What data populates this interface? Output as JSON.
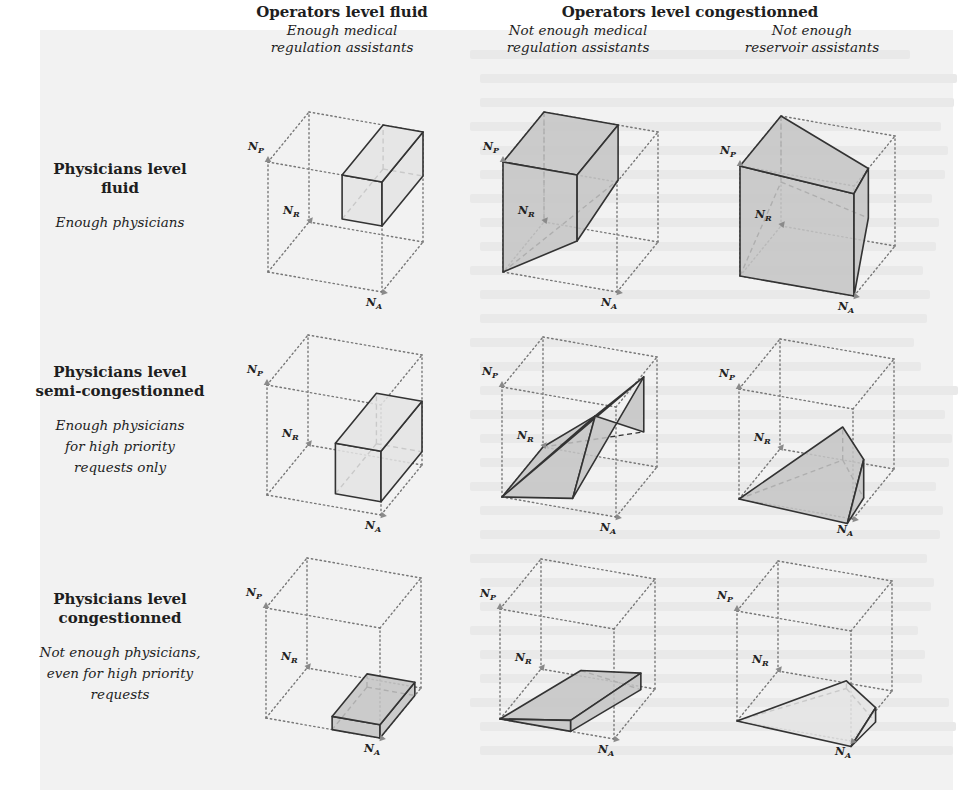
{
  "figure": {
    "column_groups": [
      {
        "title": "Operators level fluid",
        "center_x": 342,
        "top": 4
      },
      {
        "title": "Operators level congestionned",
        "center_x": 690,
        "top": 4
      }
    ],
    "columns": [
      {
        "id": "c1",
        "subtitle_lines": [
          "Enough medical",
          "regulation assistants"
        ],
        "center_x": 342
      },
      {
        "id": "c2",
        "subtitle_lines": [
          "Not enough medical",
          "regulation assistants"
        ],
        "center_x": 578
      },
      {
        "id": "c3",
        "subtitle_lines": [
          "Not enough",
          "reservoir assistants"
        ],
        "center_x": 812
      }
    ],
    "rows": [
      {
        "id": "r1",
        "title_lines": [
          "Physicians level",
          "fluid"
        ],
        "subtitle_lines": [
          "Enough physicians"
        ],
        "top": 160
      },
      {
        "id": "r2",
        "title_lines": [
          "Physicians level",
          "semi-congestionned"
        ],
        "subtitle_lines": [
          "Enough physicians",
          "for high priority",
          "requests only"
        ],
        "top": 363
      },
      {
        "id": "r3",
        "title_lines": [
          "Physicians level",
          "congestionned"
        ],
        "subtitle_lines": [
          "Not enough physicians,",
          "even for high priority",
          "requests"
        ],
        "top": 590
      }
    ],
    "axes": {
      "labels": {
        "P": "N",
        "P_sub": "P",
        "R": "N",
        "R_sub": "R",
        "A": "N",
        "A_sub": "A"
      },
      "vector_A": [
        114,
        20
      ],
      "vector_R": [
        41,
        -50
      ],
      "vector_P": [
        0,
        -110
      ]
    },
    "colors": {
      "dotted": "#777777",
      "edge": "#333333",
      "fill_light": "#e4e4e4",
      "fill_dark": "#c4c4c4",
      "arrow": "#8a8a8a"
    },
    "cells": [
      {
        "row": 0,
        "col": 0,
        "origin": [
          268,
          272
        ],
        "shade": "light",
        "shape": "box",
        "box": {
          "a": [
            0.65,
            1.0
          ],
          "r": [
            0.0,
            1.0
          ],
          "p": [
            0.6,
            1.0
          ]
        }
      },
      {
        "row": 0,
        "col": 1,
        "origin": [
          503,
          272
        ],
        "shade": "dark",
        "shape": "poly",
        "faces": [
          [
            [
              0,
              0,
              1
            ],
            [
              0.65,
              0,
              1
            ],
            [
              0.65,
              1,
              1
            ],
            [
              0,
              1,
              1
            ]
          ],
          [
            [
              0,
              0,
              0
            ],
            [
              0,
              0,
              1
            ],
            [
              0.65,
              0,
              1
            ],
            [
              0.65,
              0,
              0.4
            ]
          ],
          [
            [
              0.65,
              0,
              0.4
            ],
            [
              0.65,
              0,
              1
            ],
            [
              0.65,
              1,
              1
            ],
            [
              0.65,
              1,
              0.5
            ]
          ]
        ],
        "hidden": [
          [
            [
              0,
              1,
              1
            ],
            [
              0,
              1,
              0.0
            ]
          ],
          [
            [
              0,
              0,
              0
            ],
            [
              0.65,
              1,
              0.5
            ]
          ]
        ]
      },
      {
        "row": 0,
        "col": 2,
        "origin": [
          740,
          276
        ],
        "shade": "dark",
        "shape": "poly",
        "faces": [
          [
            [
              0,
              0,
              0
            ],
            [
              0,
              0,
              1
            ],
            [
              1,
              0,
              0.93
            ],
            [
              1,
              0,
              0
            ]
          ],
          [
            [
              0,
              0,
              1
            ],
            [
              0,
              1,
              1
            ],
            [
              1,
              0.35,
              1
            ],
            [
              1,
              0,
              0.93
            ]
          ],
          [
            [
              1,
              0,
              0
            ],
            [
              1,
              0,
              0.93
            ],
            [
              1,
              0.35,
              1
            ],
            [
              1,
              0.35,
              0.55
            ]
          ]
        ],
        "hidden": [
          [
            [
              0,
              1,
              1
            ],
            [
              0,
              1,
              0.4
            ]
          ],
          [
            [
              0,
              0,
              0
            ],
            [
              0,
              1,
              0.4
            ]
          ],
          [
            [
              0,
              1,
              0.4
            ],
            [
              1,
              0.35,
              0.55
            ]
          ]
        ]
      },
      {
        "row": 1,
        "col": 0,
        "origin": [
          267,
          495
        ],
        "shade": "light",
        "shape": "box",
        "box": {
          "a": [
            0.6,
            1.0
          ],
          "r": [
            0.0,
            1.0
          ],
          "p": [
            0.12,
            0.58
          ]
        }
      },
      {
        "row": 1,
        "col": 1,
        "origin": [
          502,
          497
        ],
        "shade": "dark",
        "shape": "poly",
        "faces": [
          [
            [
              0,
              0,
              0
            ],
            [
              0.62,
              0,
              0.1
            ],
            [
              0.62,
              0.55,
              0.6
            ],
            [
              0,
              1,
              0
            ]
          ],
          [
            [
              0,
              0,
              0
            ],
            [
              0.92,
              0.9,
              0.85
            ],
            [
              0.62,
              0.55,
              0.6
            ]
          ],
          [
            [
              0.62,
              0,
              0.1
            ],
            [
              0.92,
              0.9,
              0.85
            ],
            [
              0.92,
              0.9,
              0.35
            ],
            [
              0.62,
              0.55,
              0.6
            ]
          ]
        ],
        "hidden": [
          [
            [
              0,
              1,
              0
            ],
            [
              0.92,
              0.9,
              0.35
            ]
          ]
        ]
      },
      {
        "row": 1,
        "col": 2,
        "origin": [
          739,
          499
        ],
        "shade": "dark",
        "shape": "poly",
        "faces": [
          [
            [
              0,
              0,
              0
            ],
            [
              0.95,
              0,
              -0.05
            ],
            [
              0.95,
              0.4,
              0.35
            ],
            [
              0.55,
              1,
              0.3
            ]
          ],
          [
            [
              0.95,
              0,
              -0.05
            ],
            [
              0.95,
              0.4,
              0.35
            ],
            [
              0.95,
              0.4,
              0.0
            ]
          ]
        ],
        "hidden": [
          [
            [
              0,
              0,
              0
            ],
            [
              0.55,
              1,
              0
            ]
          ],
          [
            [
              0.55,
              1,
              0
            ],
            [
              0.55,
              1,
              0.3
            ]
          ],
          [
            [
              0.55,
              1,
              0
            ],
            [
              0.95,
              0.4,
              0.0
            ]
          ]
        ]
      },
      {
        "row": 2,
        "col": 0,
        "origin": [
          266,
          718
        ],
        "shade": "dark",
        "shape": "box",
        "box": {
          "a": [
            0.58,
            1.0
          ],
          "r": [
            0.0,
            0.85
          ],
          "p": [
            0.0,
            0.12
          ]
        }
      },
      {
        "row": 2,
        "col": 1,
        "origin": [
          500,
          719
        ],
        "shade": "dark",
        "shape": "poly",
        "faces": [
          [
            [
              0,
              0,
              0
            ],
            [
              0.62,
              0,
              0.1
            ],
            [
              0.93,
              0.85,
              0.2
            ],
            [
              0.35,
              1,
              0.05
            ]
          ],
          [
            [
              0,
              0,
              0
            ],
            [
              0.62,
              0,
              0.0
            ],
            [
              0.62,
              0,
              0.1
            ]
          ],
          [
            [
              0.62,
              0,
              0.0
            ],
            [
              0.62,
              0,
              0.1
            ],
            [
              0.93,
              0.85,
              0.2
            ],
            [
              0.93,
              0.85,
              0.05
            ]
          ]
        ],
        "hidden": [
          [
            [
              0.35,
              1,
              0.05
            ],
            [
              0.93,
              0.85,
              0.05
            ]
          ]
        ]
      },
      {
        "row": 2,
        "col": 2,
        "origin": [
          737,
          721
        ],
        "shade": "light",
        "shape": "poly",
        "faces": [
          [
            [
              0,
              0,
              0
            ],
            [
              1,
              0,
              -0.05
            ],
            [
              1,
              0.6,
              0.03
            ],
            [
              0.6,
              1,
              0.02
            ]
          ],
          [
            [
              1,
              0,
              -0.05
            ],
            [
              1,
              0.6,
              0.03
            ],
            [
              1,
              0.6,
              -0.1
            ]
          ]
        ],
        "hidden": [
          [
            [
              0,
              0,
              0
            ],
            [
              0.6,
              1,
              -0.05
            ]
          ],
          [
            [
              0.6,
              1,
              -0.05
            ],
            [
              1,
              0.6,
              -0.1
            ]
          ],
          [
            [
              0.6,
              1,
              -0.05
            ],
            [
              0.6,
              1,
              0.02
            ]
          ]
        ]
      }
    ]
  }
}
